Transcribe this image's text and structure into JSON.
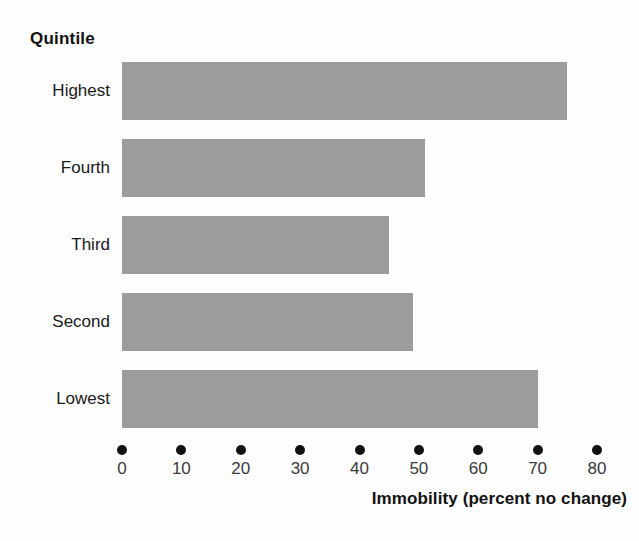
{
  "chart_data": {
    "type": "bar",
    "orientation": "horizontal",
    "title": "",
    "xlabel": "Immobility (percent no change)",
    "ylabel": "Quintile",
    "categories": [
      "Highest",
      "Fourth",
      "Third",
      "Second",
      "Lowest"
    ],
    "values": [
      75,
      51,
      45,
      49,
      70
    ],
    "xlim": [
      0,
      80
    ],
    "xticks": [
      0,
      10,
      20,
      30,
      40,
      50,
      60,
      70,
      80
    ],
    "xtick_labels": [
      "0",
      "10",
      "20",
      "30",
      "40",
      "50",
      "60",
      "70",
      "80"
    ],
    "grid": false,
    "legend": false,
    "bar_color": "#9c9c9c",
    "background_color": "#fdfdfd",
    "text_color": "#111111",
    "tick_marker_style": "dot"
  }
}
